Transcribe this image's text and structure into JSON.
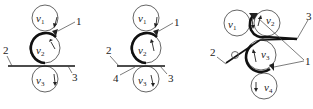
{
  "figure": {
    "panels": [
      {
        "id": "a",
        "rolls": [
          {
            "label": "v",
            "sub": "1"
          },
          {
            "label": "v",
            "sub": "2"
          },
          {
            "label": "v",
            "sub": "3"
          }
        ],
        "callouts": [
          "1",
          "2",
          "3"
        ]
      },
      {
        "id": "b",
        "rolls": [
          {
            "label": "v",
            "sub": "1"
          },
          {
            "label": "v",
            "sub": "2"
          },
          {
            "label": "v",
            "sub": "3"
          }
        ],
        "callouts": [
          "1",
          "2",
          "3",
          "4"
        ]
      },
      {
        "id": "c",
        "rolls": [
          {
            "label": "v",
            "sub": "1"
          },
          {
            "label": "v",
            "sub": "2"
          },
          {
            "label": "v",
            "sub": "3"
          },
          {
            "label": "v",
            "sub": "4"
          }
        ],
        "callouts": [
          "1",
          "2",
          "3"
        ]
      }
    ]
  }
}
